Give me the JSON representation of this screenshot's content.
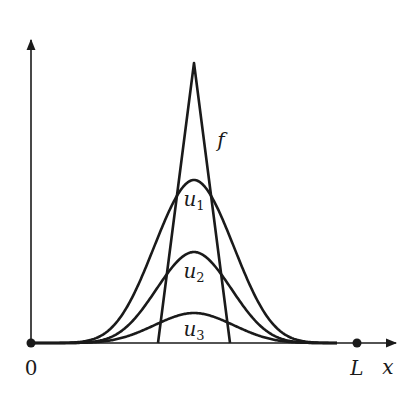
{
  "figure": {
    "type": "diagram",
    "axes": {
      "origin_px": [
        31,
        343
      ],
      "x_axis_end_px": [
        396,
        343
      ],
      "y_axis_end_px": [
        31,
        40
      ],
      "x_label": "x",
      "origin_label": "0",
      "end_label": "L",
      "L_px": 357
    },
    "curves": [
      {
        "name": "f",
        "kind": "triangle",
        "center_px": 194,
        "base_left_px": 158,
        "base_right_px": 230,
        "peak_height_px": 280,
        "label": "f",
        "label_pos_px": [
          221,
          140
        ]
      },
      {
        "name": "u1",
        "kind": "bump",
        "center_px": 194,
        "peak_height_px": 163,
        "sigma_px": 36,
        "label_main": "u",
        "label_sub": "1",
        "label_pos_px": [
          194,
          200
        ]
      },
      {
        "name": "u2",
        "kind": "bump",
        "center_px": 194,
        "peak_height_px": 91,
        "sigma_px": 34,
        "label_main": "u",
        "label_sub": "2",
        "label_pos_px": [
          194,
          272
        ]
      },
      {
        "name": "u3",
        "kind": "bump",
        "center_px": 194,
        "peak_height_px": 30,
        "sigma_px": 36,
        "label_main": "u",
        "label_sub": "3",
        "label_pos_px": [
          194,
          330
        ]
      }
    ],
    "colors": {
      "ink": "#1a1a1a",
      "background": "#ffffff"
    }
  }
}
